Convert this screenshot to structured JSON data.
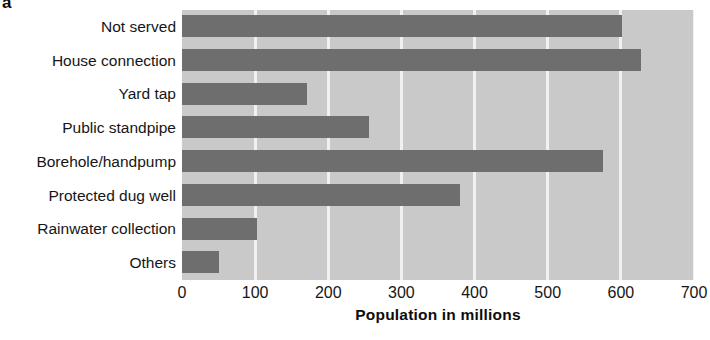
{
  "panel": {
    "letter": "a"
  },
  "chart_data": {
    "type": "bar",
    "orientation": "horizontal",
    "title": "",
    "subtitle": "",
    "xlabel": "Population in millions",
    "ylabel": "",
    "categories": [
      "Not served",
      "House connection",
      "Yard tap",
      "Public standpipe",
      "Borehole/handpump",
      "Protected dug well",
      "Rainwater collection",
      "Others"
    ],
    "values": [
      602,
      628,
      171,
      256,
      576,
      380,
      102,
      51
    ],
    "series": [
      {
        "name": "Population in millions",
        "values": [
          602,
          628,
          171,
          256,
          576,
          380,
          102,
          51
        ]
      }
    ],
    "xlim": [
      0,
      700
    ],
    "xticks": [
      0,
      100,
      200,
      300,
      400,
      500,
      600,
      700
    ],
    "xtick_labels": [
      "0",
      "100",
      "200",
      "300",
      "400",
      "500",
      "600",
      "700"
    ],
    "grid": "vertical-only",
    "legend": "none",
    "colors": {
      "bar": "#6e6e6e",
      "plot_background": "#c9c9c9",
      "gridline": "#f1f1f1",
      "figure_background": "#ffffff",
      "text": "#161616"
    }
  }
}
